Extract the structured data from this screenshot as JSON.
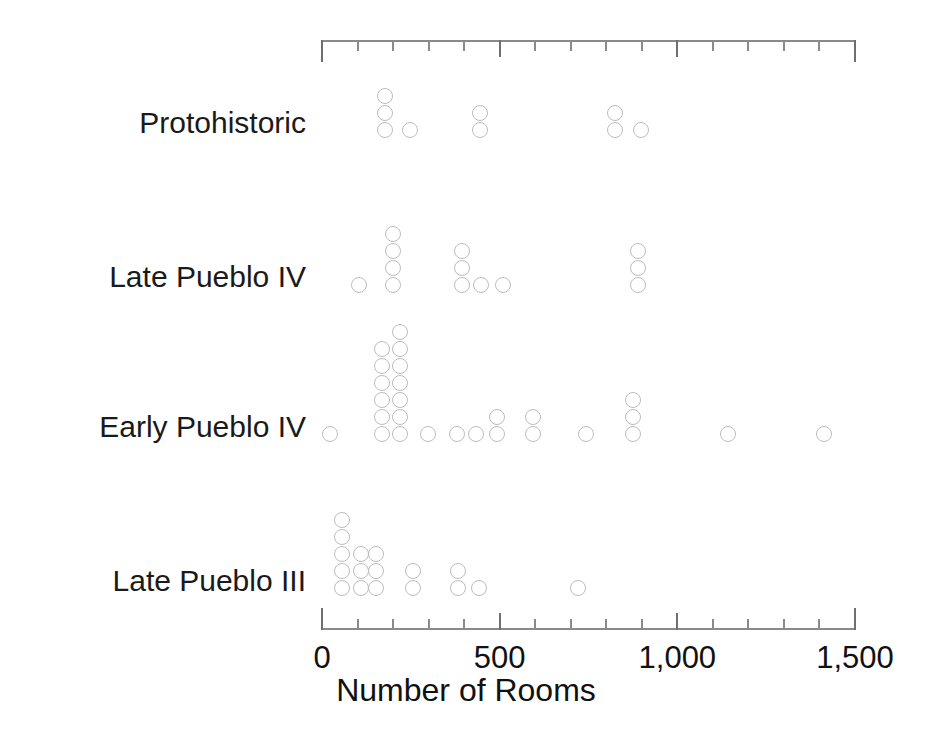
{
  "chart_data": {
    "type": "scatter",
    "title": "",
    "xlabel": "Number of Rooms",
    "ylabel": "",
    "xlim": [
      0,
      1500
    ],
    "grid": false,
    "legend": false,
    "x_ticks_major": [
      0,
      500,
      1000,
      1500
    ],
    "x_tick_labels": [
      "0",
      "500",
      "1,000",
      "1,500"
    ],
    "x_ticks_minor_step": 100,
    "categories": [
      "Protohistoric",
      "Late Pueblo IV",
      "Early Pueblo IV",
      "Late Pueblo III"
    ],
    "series": [
      {
        "name": "Protohistoric",
        "counts": [
          {
            "x": 180,
            "n": 3
          },
          {
            "x": 250,
            "n": 1
          },
          {
            "x": 445,
            "n": 2
          },
          {
            "x": 825,
            "n": 2
          },
          {
            "x": 900,
            "n": 1
          }
        ],
        "total": 9
      },
      {
        "name": "Late Pueblo IV",
        "counts": [
          {
            "x": 105,
            "n": 1
          },
          {
            "x": 200,
            "n": 4
          },
          {
            "x": 395,
            "n": 3
          },
          {
            "x": 450,
            "n": 1
          },
          {
            "x": 510,
            "n": 1
          },
          {
            "x": 890,
            "n": 3
          }
        ],
        "total": 13
      },
      {
        "name": "Early Pueblo IV",
        "counts": [
          {
            "x": 25,
            "n": 1
          },
          {
            "x": 170,
            "n": 6
          },
          {
            "x": 220,
            "n": 7
          },
          {
            "x": 300,
            "n": 1
          },
          {
            "x": 380,
            "n": 1
          },
          {
            "x": 435,
            "n": 1
          },
          {
            "x": 495,
            "n": 2
          },
          {
            "x": 595,
            "n": 2
          },
          {
            "x": 745,
            "n": 1
          },
          {
            "x": 878,
            "n": 3
          },
          {
            "x": 1145,
            "n": 1
          },
          {
            "x": 1415,
            "n": 1
          }
        ],
        "total": 27
      },
      {
        "name": "Late Pueblo III",
        "counts": [
          {
            "x": 57,
            "n": 5
          },
          {
            "x": 110,
            "n": 3
          },
          {
            "x": 152,
            "n": 3
          },
          {
            "x": 257,
            "n": 2
          },
          {
            "x": 385,
            "n": 2
          },
          {
            "x": 443,
            "n": 1
          },
          {
            "x": 723,
            "n": 1
          }
        ],
        "total": 17
      }
    ]
  },
  "axis": {
    "title": "Number of Rooms",
    "tick_labels": [
      "0",
      "500",
      "1,000",
      "1,500"
    ]
  },
  "colors": {
    "dot_stroke": "#bdbdbd",
    "axis": "#8a8a8a",
    "text": "#111111",
    "background": "#ffffff"
  },
  "layout": {
    "plot_left_px": 322,
    "plot_right_px": 855,
    "top_axis_y_px": 40,
    "bottom_axis_y_px": 628,
    "baseline_y_px": {
      "Protohistoric": 130,
      "Late Pueblo IV": 285,
      "Early Pueblo IV": 434,
      "Late Pueblo III": 588
    },
    "dot_diameter_px": 17,
    "dot_vspacing_px": 17
  }
}
